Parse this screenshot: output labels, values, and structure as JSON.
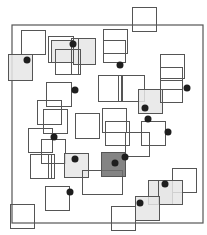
{
  "diagram": {
    "width": 207,
    "height": 235,
    "background": "#ffffff",
    "stroke_color": "#555555",
    "colors": {
      "none": "none",
      "light": "#e6e6e6",
      "dark": "#6e6e6e",
      "dot": "#1e1e1e"
    },
    "frame": {
      "x": 12,
      "y": 25,
      "w": 191,
      "h": 198
    },
    "squares": [
      {
        "x": 21,
        "y": 30,
        "w": 24,
        "h": 24,
        "fill": "none"
      },
      {
        "x": 8,
        "y": 54,
        "w": 24,
        "h": 26,
        "fill": "light"
      },
      {
        "x": 48,
        "y": 36,
        "w": 25,
        "h": 26,
        "fill": "none"
      },
      {
        "x": 51,
        "y": 40,
        "w": 22,
        "h": 22,
        "fill": "light"
      },
      {
        "x": 73,
        "y": 38,
        "w": 22,
        "h": 26,
        "fill": "light"
      },
      {
        "x": 55,
        "y": 49,
        "w": 25,
        "h": 25,
        "fill": "none"
      },
      {
        "x": 71,
        "y": 38,
        "w": 7,
        "h": 36,
        "fill": "none"
      },
      {
        "x": 132,
        "y": 7,
        "w": 24,
        "h": 24,
        "fill": "none"
      },
      {
        "x": 103,
        "y": 29,
        "w": 24,
        "h": 24,
        "fill": "none"
      },
      {
        "x": 103,
        "y": 40,
        "w": 22,
        "h": 22,
        "fill": "none"
      },
      {
        "x": 98,
        "y": 75,
        "w": 24,
        "h": 26,
        "fill": "none"
      },
      {
        "x": 118,
        "y": 75,
        "w": 26,
        "h": 26,
        "fill": "none"
      },
      {
        "x": 118,
        "y": 75,
        "w": 3,
        "h": 26,
        "fill": "none"
      },
      {
        "x": 138,
        "y": 89,
        "w": 24,
        "h": 24,
        "fill": "light"
      },
      {
        "x": 160,
        "y": 54,
        "w": 24,
        "h": 24,
        "fill": "none"
      },
      {
        "x": 160,
        "y": 67,
        "w": 22,
        "h": 22,
        "fill": "none"
      },
      {
        "x": 160,
        "y": 80,
        "w": 22,
        "h": 22,
        "fill": "none"
      },
      {
        "x": 46,
        "y": 82,
        "w": 25,
        "h": 24,
        "fill": "none"
      },
      {
        "x": 37,
        "y": 100,
        "w": 24,
        "h": 24,
        "fill": "none"
      },
      {
        "x": 43,
        "y": 109,
        "w": 24,
        "h": 24,
        "fill": "none"
      },
      {
        "x": 28,
        "y": 128,
        "w": 24,
        "h": 24,
        "fill": "none"
      },
      {
        "x": 41,
        "y": 139,
        "w": 24,
        "h": 24,
        "fill": "none"
      },
      {
        "x": 75,
        "y": 113,
        "w": 24,
        "h": 25,
        "fill": "none"
      },
      {
        "x": 102,
        "y": 108,
        "w": 24,
        "h": 24,
        "fill": "none"
      },
      {
        "x": 105,
        "y": 121,
        "w": 24,
        "h": 24,
        "fill": "none"
      },
      {
        "x": 141,
        "y": 121,
        "w": 24,
        "h": 24,
        "fill": "none"
      },
      {
        "x": 125,
        "y": 132,
        "w": 24,
        "h": 24,
        "fill": "none"
      },
      {
        "x": 30,
        "y": 154,
        "w": 24,
        "h": 24,
        "fill": "none"
      },
      {
        "x": 48,
        "y": 154,
        "w": 3,
        "h": 24,
        "fill": "none"
      },
      {
        "x": 64,
        "y": 153,
        "w": 24,
        "h": 24,
        "fill": "light"
      },
      {
        "x": 82,
        "y": 170,
        "w": 40,
        "h": 24,
        "fill": "none"
      },
      {
        "x": 101,
        "y": 152,
        "w": 24,
        "h": 24,
        "fill": "dark"
      },
      {
        "x": 45,
        "y": 186,
        "w": 24,
        "h": 24,
        "fill": "none"
      },
      {
        "x": 10,
        "y": 204,
        "w": 24,
        "h": 24,
        "fill": "none"
      },
      {
        "x": 111,
        "y": 206,
        "w": 24,
        "h": 24,
        "fill": "none"
      },
      {
        "x": 172,
        "y": 168,
        "w": 24,
        "h": 24,
        "fill": "none"
      },
      {
        "x": 148,
        "y": 180,
        "w": 24,
        "h": 24,
        "fill": "light"
      },
      {
        "x": 158,
        "y": 180,
        "w": 24,
        "h": 24,
        "fill": "light"
      },
      {
        "x": 135,
        "y": 196,
        "w": 24,
        "h": 24,
        "fill": "light"
      }
    ],
    "dots": [
      {
        "x": 27,
        "y": 60,
        "r": 3.5
      },
      {
        "x": 73,
        "y": 44,
        "r": 3.5
      },
      {
        "x": 120,
        "y": 65,
        "r": 3.5
      },
      {
        "x": 75,
        "y": 90,
        "r": 3.5
      },
      {
        "x": 187,
        "y": 88,
        "r": 3.5
      },
      {
        "x": 145,
        "y": 108,
        "r": 3.5
      },
      {
        "x": 148,
        "y": 119,
        "r": 3.5
      },
      {
        "x": 168,
        "y": 132,
        "r": 3.5
      },
      {
        "x": 54,
        "y": 137,
        "r": 3.5
      },
      {
        "x": 75,
        "y": 159,
        "r": 3.5
      },
      {
        "x": 125,
        "y": 157,
        "r": 3.5
      },
      {
        "x": 115,
        "y": 163,
        "r": 3.5
      },
      {
        "x": 70,
        "y": 192,
        "r": 3.5
      },
      {
        "x": 165,
        "y": 184,
        "r": 3.5
      },
      {
        "x": 140,
        "y": 203,
        "r": 3.5
      }
    ]
  }
}
